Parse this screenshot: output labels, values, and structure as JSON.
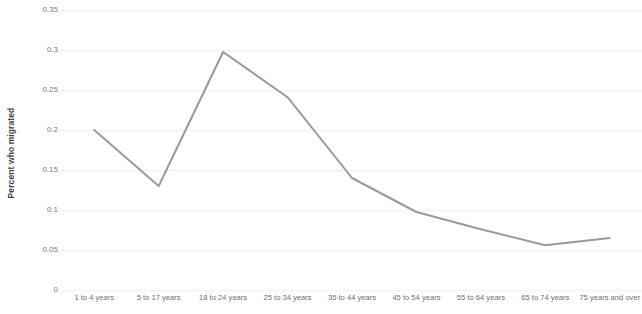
{
  "chart_data": {
    "type": "line",
    "title": "",
    "subtitle": "",
    "xlabel": "",
    "ylabel": "Percent who migrated",
    "categories": [
      "1 to 4 years",
      "5 to 17 years",
      "18 to 24 years",
      "25 to 34 years",
      "35 to 44 years",
      "45 to 54 years",
      "55 to 64 years",
      "65 to 74 years",
      "75 years and over"
    ],
    "values": [
      0.2,
      0.13,
      0.2975,
      0.241,
      0.14,
      0.0975,
      0.076,
      0.056,
      0.065
    ],
    "series": [
      {
        "name": "Percent who migrated",
        "values": [
          0.2,
          0.13,
          0.2975,
          0.241,
          0.14,
          0.0975,
          0.076,
          0.056,
          0.065
        ],
        "color": "#9a9a9a"
      }
    ],
    "ylim": [
      0,
      0.35
    ],
    "yticks": [
      0,
      0.05,
      0.1,
      0.15,
      0.2,
      0.25,
      0.3,
      0.35
    ],
    "ytick_labels": [
      "0",
      "0.05",
      "0.1",
      "0.15",
      "0.2",
      "0.25",
      "0.3",
      "0.35"
    ],
    "grid": true,
    "grid_axis": "y",
    "grid_color": "#f2f2f2",
    "legend": false,
    "legend_position": "none",
    "markers": false,
    "line_width": 2,
    "background_color": "#ffffff",
    "axis_label_color": "#7b7b7b"
  }
}
